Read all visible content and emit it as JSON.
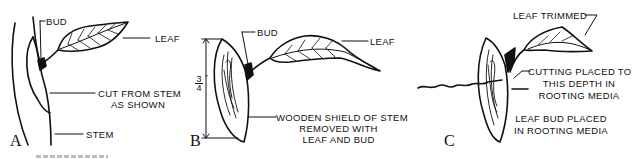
{
  "panels": [
    {
      "id": "A",
      "letter": "A",
      "labels": {
        "bud": "BUD",
        "leaf": "LEAF",
        "cut_line1": "CUT FROM STEM",
        "cut_line2": "AS SHOWN",
        "stem": "STEM"
      }
    },
    {
      "id": "B",
      "letter": "B",
      "labels": {
        "bud": "BUD",
        "leaf": "LEAF",
        "measure_num": "3",
        "measure_den": "4",
        "measure_unit": "\"",
        "shield_line1": "WOODEN SHIELD OF STEM",
        "shield_line2": "REMOVED WITH",
        "shield_line3": "LEAF AND BUD"
      }
    },
    {
      "id": "C",
      "letter": "C",
      "labels": {
        "leaf_trimmed": "LEAF TRIMMED",
        "depth_line1": "CUTTING PLACED TO",
        "depth_line2": "THIS DEPTH IN",
        "depth_line3": "ROOTING MEDIA",
        "bud_line1": "LEAF BUD PLACED",
        "bud_line2": "IN ROOTING MEDIA"
      }
    }
  ]
}
